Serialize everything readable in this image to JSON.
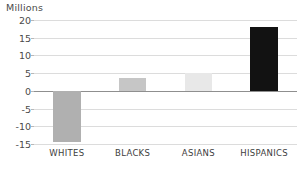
{
  "chart_data": {
    "type": "bar",
    "title": "",
    "units_label": "Millions",
    "xlabel": "",
    "ylabel": "Millions",
    "categories": [
      "WHITES",
      "BLACKS",
      "ASIANS",
      "HISPANICS"
    ],
    "values": [
      -14.5,
      3.5,
      5.0,
      18.0
    ],
    "bar_colors": [
      "#b0b0b0",
      "#c6c6c6",
      "#e8e8e8",
      "#121212"
    ],
    "ylim": [
      -15,
      20
    ],
    "yticks": [
      20,
      15,
      10,
      5,
      0,
      -5,
      -10,
      -15
    ],
    "ytick_labels": [
      "20",
      "15",
      "10",
      "5",
      "0",
      "-5",
      "-10",
      "-15"
    ],
    "grid": true,
    "gridline_color": "#dcdcdc",
    "zero_line_color": "#8f8f8f",
    "legend": null,
    "legend_position": "none",
    "annotations": []
  },
  "bottom_caption": {
    "text": ""
  }
}
